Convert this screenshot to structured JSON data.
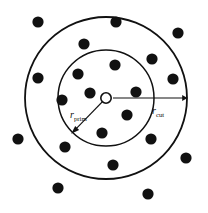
{
  "figure": {
    "background_color": "#ffffff",
    "stroke_color": "#111111",
    "width": 208,
    "height": 213
  },
  "chart_data": {
    "type": "scatter",
    "title": "",
    "xlabel": "",
    "ylabel": "",
    "xlim": [
      0,
      208
    ],
    "ylim": [
      0,
      213
    ],
    "grid": false,
    "legend_position": "none",
    "center": {
      "x": 106,
      "y": 98,
      "marker": "open-circle",
      "radius": 5.2
    },
    "circles": [
      {
        "name": "inner-circle",
        "label": "r_prim",
        "cx": 106,
        "cy": 98,
        "r": 48,
        "stroke_width": 1.5
      },
      {
        "name": "outer-circle",
        "label": "r_cut",
        "cx": 106,
        "cy": 98,
        "r": 81,
        "stroke_width": 1.8
      }
    ],
    "annotations": [
      {
        "name": "r-prim-arrow",
        "base": "r",
        "sub": "prim",
        "from": {
          "x": 106,
          "y": 98
        },
        "to": {
          "x": 72,
          "y": 133
        },
        "label_x": 72,
        "label_y": 116
      },
      {
        "name": "r-cut-arrow",
        "base": "r",
        "sub": "cut",
        "from": {
          "x": 113,
          "y": 98
        },
        "to": {
          "x": 187,
          "y": 98
        },
        "label_x": 152,
        "label_y": 112
      }
    ],
    "point_radius": 5.6,
    "points": [
      {
        "x": 38,
        "y": 22,
        "region": "outside"
      },
      {
        "x": 116,
        "y": 22,
        "region": "annulus"
      },
      {
        "x": 178,
        "y": 33,
        "region": "outside"
      },
      {
        "x": 84,
        "y": 44,
        "region": "annulus"
      },
      {
        "x": 152,
        "y": 59,
        "region": "annulus"
      },
      {
        "x": 115,
        "y": 65,
        "region": "inner"
      },
      {
        "x": 78,
        "y": 74,
        "region": "inner"
      },
      {
        "x": 38,
        "y": 78,
        "region": "annulus"
      },
      {
        "x": 173,
        "y": 79,
        "region": "annulus"
      },
      {
        "x": 90,
        "y": 93,
        "region": "inner"
      },
      {
        "x": 136,
        "y": 92,
        "region": "inner"
      },
      {
        "x": 62,
        "y": 100,
        "region": "inner"
      },
      {
        "x": 127,
        "y": 115,
        "region": "inner"
      },
      {
        "x": 18,
        "y": 139,
        "region": "outside"
      },
      {
        "x": 102,
        "y": 133,
        "region": "inner"
      },
      {
        "x": 151,
        "y": 139,
        "region": "annulus"
      },
      {
        "x": 65,
        "y": 147,
        "region": "annulus"
      },
      {
        "x": 186,
        "y": 158,
        "region": "outside"
      },
      {
        "x": 113,
        "y": 165,
        "region": "annulus"
      },
      {
        "x": 58,
        "y": 188,
        "region": "outside"
      },
      {
        "x": 148,
        "y": 194,
        "region": "outside"
      }
    ]
  }
}
